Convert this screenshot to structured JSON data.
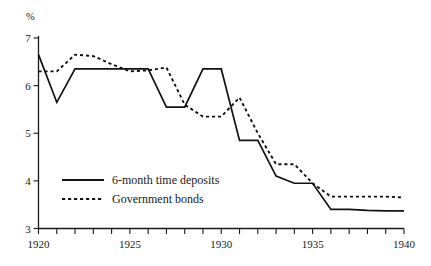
{
  "chart_data": {
    "type": "line",
    "title": "",
    "xlabel": "",
    "ylabel": "%",
    "unit_label": "%",
    "xlim": [
      1920,
      1940
    ],
    "ylim": [
      3,
      7
    ],
    "x_tick_interval": 1,
    "x_tick_labels": [
      "1920",
      "1925",
      "1930",
      "1935",
      "1940"
    ],
    "x_tick_label_years": [
      1920,
      1925,
      1930,
      1935,
      1940
    ],
    "y_tick_labels": [
      "3",
      "4",
      "5",
      "6",
      "7"
    ],
    "y_tick_values": [
      3,
      4,
      5,
      6,
      7
    ],
    "grid": false,
    "legend_position": "lower-left-inside",
    "x": [
      1920,
      1921,
      1922,
      1923,
      1924,
      1925,
      1926,
      1927,
      1928,
      1929,
      1930,
      1931,
      1932,
      1933,
      1934,
      1935,
      1936,
      1937,
      1938,
      1939,
      1940
    ],
    "series": [
      {
        "name": "6-month time deposits",
        "style": "solid",
        "values": [
          6.65,
          5.65,
          6.35,
          6.35,
          6.35,
          6.35,
          6.35,
          5.55,
          5.55,
          6.35,
          6.35,
          4.85,
          4.85,
          4.1,
          3.95,
          3.95,
          3.4,
          3.4,
          3.38,
          3.37,
          3.37
        ]
      },
      {
        "name": "Government bonds",
        "style": "dashed",
        "values": [
          6.3,
          6.3,
          6.65,
          6.62,
          6.45,
          6.3,
          6.32,
          6.38,
          5.6,
          5.35,
          5.35,
          5.75,
          5.0,
          4.35,
          4.35,
          3.95,
          3.67,
          3.67,
          3.67,
          3.67,
          3.65
        ]
      }
    ],
    "legend": [
      {
        "label": "6-month time deposits",
        "style": "solid"
      },
      {
        "label": "Government bonds",
        "style": "dashed"
      }
    ],
    "colors": {
      "series": "#121212",
      "axis": "#1a1a1a",
      "background": "#ffffff"
    }
  }
}
